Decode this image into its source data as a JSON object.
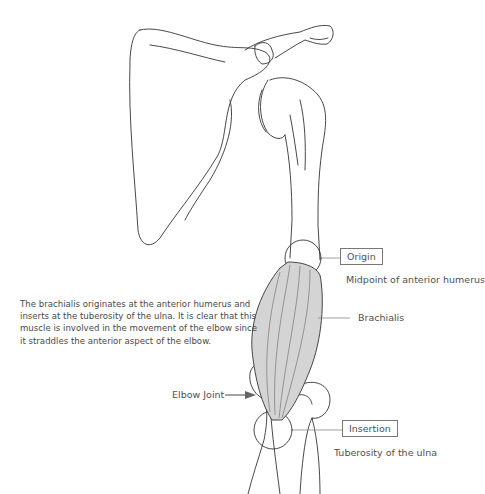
{
  "diagram": {
    "description": "The brachialis originates at the anterior humerus and inserts at the tuberosity of the ulna. It is clear that this muscle is involved in the movement of the elbow since it straddles the anterior aspect of the elbow.",
    "labels": {
      "origin": "Origin",
      "origin_detail": "Midpoint of anterior humerus",
      "muscle": "Brachialis",
      "elbow": "Elbow Joint",
      "insertion": "Insertion",
      "insertion_detail": "Tuberosity of the ulna"
    },
    "colors": {
      "muscle_fill": "#d4d4d4",
      "line": "#333333",
      "leader": "#888888"
    }
  }
}
